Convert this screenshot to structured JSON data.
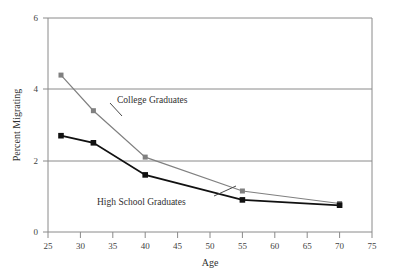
{
  "chart_data": {
    "type": "line",
    "title": "",
    "xlabel": "Age",
    "ylabel": "Percent Migrating",
    "xlim": [
      25,
      75
    ],
    "ylim": [
      0,
      6
    ],
    "xticks": [
      25,
      30,
      35,
      40,
      45,
      50,
      55,
      60,
      65,
      70,
      75
    ],
    "yticks": [
      0,
      2,
      4,
      6
    ],
    "xtick_labels": [
      "25",
      "30",
      "35",
      "40",
      "45",
      "50",
      "55",
      "60",
      "65",
      "70",
      "75"
    ],
    "ytick_labels": [
      "0",
      "2",
      "4",
      "6"
    ],
    "grid": "horizontal",
    "legend_position": "inline-annotations",
    "x": [
      27,
      32,
      40,
      55,
      70
    ],
    "series": [
      {
        "name": "College Graduates",
        "color": "#808080",
        "marker": "square",
        "values": [
          4.4,
          3.4,
          2.1,
          1.15,
          0.8
        ]
      },
      {
        "name": "High School Graduates",
        "color": "#111111",
        "marker": "square",
        "values": [
          2.7,
          2.5,
          1.6,
          0.9,
          0.75
        ]
      }
    ],
    "annotations": [
      {
        "text": "College Graduates",
        "x": 38.5,
        "y": 3.35
      },
      {
        "text": "High School Graduates",
        "x": 33.0,
        "y": 0.95
      }
    ]
  },
  "axis": {
    "x_title": "Age",
    "y_title": "Percent Migrating"
  }
}
